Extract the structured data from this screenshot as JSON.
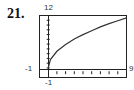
{
  "problem_number": "21.",
  "window": {
    "xmin": "-1",
    "xmax": "9",
    "ymin": "-1",
    "ymax": "12"
  },
  "chart_data": {
    "type": "line",
    "title": "",
    "xlabel": "",
    "ylabel": "",
    "xlim": [
      -1,
      9
    ],
    "ylim": [
      -1,
      12
    ],
    "grid": false,
    "x": [
      0,
      0.25,
      1,
      2,
      3,
      4,
      5,
      6,
      7,
      8,
      9
    ],
    "series": [
      {
        "name": "curve",
        "values": [
          1.0,
          2.75,
          4.5,
          5.9,
          7.1,
          8.0,
          8.8,
          9.6,
          10.3,
          10.9,
          11.5
        ]
      }
    ],
    "tick_labels": {
      "x": [
        "-1",
        "9"
      ],
      "y": [
        "-1",
        "12"
      ]
    }
  }
}
